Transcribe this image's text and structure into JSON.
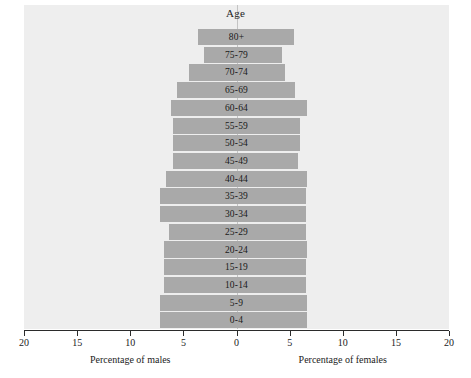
{
  "chart_data": {
    "type": "bar",
    "subtype": "population-pyramid",
    "title": "Age",
    "xlabel_left": "Percentage of males",
    "xlabel_right": "Percentage of females",
    "ylabel": "Age",
    "grid": false,
    "legend": "none",
    "xlim": [
      -20,
      20
    ],
    "x_ticks": [
      {
        "label": "20",
        "value": -20
      },
      {
        "label": "15",
        "value": -15
      },
      {
        "label": "10",
        "value": -10
      },
      {
        "label": "5",
        "value": -5
      },
      {
        "label": "0",
        "value": 0
      },
      {
        "label": "5",
        "value": 5
      },
      {
        "label": "10",
        "value": 10
      },
      {
        "label": "15",
        "value": 15
      },
      {
        "label": "20",
        "value": 20
      }
    ],
    "categories": [
      "80+",
      "75-79",
      "70-74",
      "65-69",
      "60-64",
      "55-59",
      "50-54",
      "45-49",
      "40-44",
      "35-39",
      "30-34",
      "25-29",
      "20-24",
      "15-19",
      "10-14",
      "5-9",
      "0-4"
    ],
    "series": [
      {
        "name": "Percentage of males",
        "side": "left",
        "color": "#a9a9a9",
        "values": [
          3.6,
          3.1,
          4.5,
          5.6,
          6.2,
          6.0,
          6.0,
          6.0,
          6.6,
          7.2,
          7.2,
          6.4,
          6.8,
          6.8,
          6.8,
          7.2,
          7.2
        ]
      },
      {
        "name": "Percentage of females",
        "side": "right",
        "color": "#a9a9a9",
        "values": [
          5.4,
          4.3,
          4.6,
          5.5,
          6.6,
          6.0,
          6.0,
          5.8,
          6.6,
          6.5,
          6.5,
          6.5,
          6.6,
          6.5,
          6.5,
          6.6,
          6.6
        ]
      }
    ],
    "bar_colors": {
      "male": "#a9a9a9",
      "female": "#a9a9a9"
    },
    "panel_background": "#eeeeee",
    "axis_color": "#2b2b2b"
  }
}
